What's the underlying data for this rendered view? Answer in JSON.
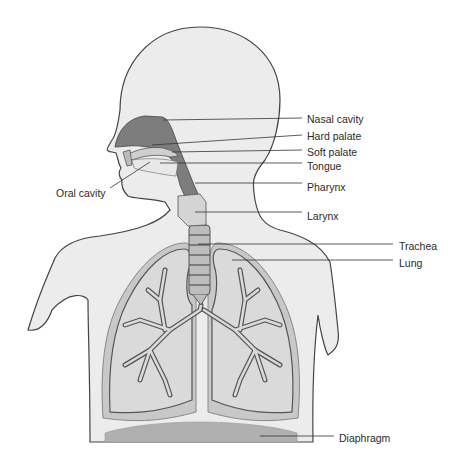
{
  "diagram": {
    "labels": {
      "nasal_cavity": "Nasal cavity",
      "hard_palate": "Hard palate",
      "soft_palate": "Soft palate",
      "tongue": "Tongue",
      "oral_cavity": "Oral cavity",
      "pharynx": "Pharynx",
      "larynx": "Larynx",
      "trachea": "Trachea",
      "lung": "Lung",
      "diaphragm": "Diaphragm"
    },
    "colors": {
      "body_fill": "#ececec",
      "body_stroke": "#444444",
      "airway_fill": "#7d7d7d",
      "lung_fill": "#d6d6d6",
      "lung_border": "#b9b9b9",
      "diaphragm_fill": "#b0b0b0",
      "leader_line": "#333333"
    }
  }
}
